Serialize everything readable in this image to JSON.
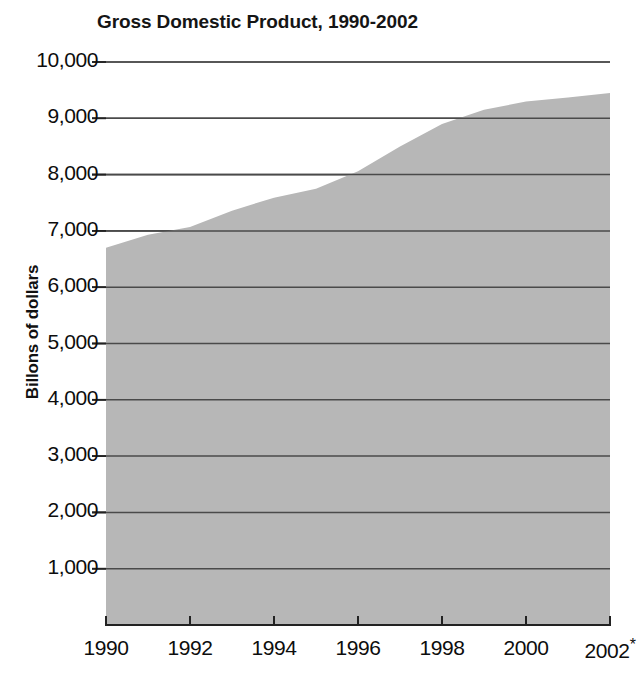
{
  "chart_data": {
    "type": "area",
    "title": "Gross Domestic Product, 1990-2002",
    "xlabel": "",
    "ylabel": "Billons of dollars",
    "x": [
      1990,
      1991,
      1992,
      1993,
      1994,
      1995,
      1996,
      1997,
      1998,
      1999,
      2000,
      2001,
      2002
    ],
    "values": [
      6700,
      6930,
      7070,
      7360,
      7590,
      7750,
      8060,
      8500,
      8900,
      9150,
      9300,
      9370,
      9450
    ],
    "categories": [
      "1990",
      "1991",
      "1992",
      "1993",
      "1994",
      "1995",
      "1996",
      "1997",
      "1998",
      "1999",
      "2000",
      "2001",
      "2002*"
    ],
    "xlim": [
      1990,
      2002
    ],
    "ylim": [
      0,
      10000
    ],
    "grid": true,
    "legend": false,
    "xtick_labels": [
      "1990",
      "1992",
      "1994",
      "1996",
      "1998",
      "2000",
      "2002*"
    ],
    "xtick_values": [
      1990,
      1992,
      1994,
      1996,
      1998,
      2000,
      2002
    ],
    "ytick_labels": [
      "1,000",
      "2,000",
      "3,000",
      "4,000",
      "5,000",
      "6,000",
      "7,000",
      "8,000",
      "9,000",
      "10,000"
    ],
    "ytick_values": [
      1000,
      2000,
      3000,
      4000,
      5000,
      6000,
      7000,
      8000,
      9000,
      10000
    ],
    "series": [
      {
        "name": "Gross Domestic Product",
        "values": [
          6700,
          6930,
          7070,
          7360,
          7590,
          7750,
          8060,
          8500,
          8900,
          9150,
          9300,
          9370,
          9450
        ]
      }
    ],
    "annotations": [
      "2002*"
    ],
    "colors": {
      "area_fill": "#b7b7b7",
      "gridline": "#555555",
      "axis": "#222222",
      "text": "#0d0d0d",
      "background": "#ffffff"
    }
  }
}
